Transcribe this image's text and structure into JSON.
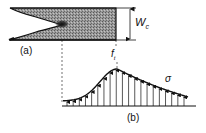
{
  "figure": {
    "panel_a": {
      "label": "(a)",
      "description": "specimen with crack and fracture process zone",
      "dimension": {
        "symbol": "W",
        "subscript": "c"
      }
    },
    "panel_b": {
      "label": "(b)",
      "description": "stress distribution along the fracture process zone",
      "peak": {
        "symbol": "f",
        "subscript": "t"
      },
      "curve_label": "σ",
      "arrow_count": 20
    },
    "colors": {
      "ink": "#111111",
      "shade": "#8a8a8a",
      "background": "#ffffff"
    }
  }
}
